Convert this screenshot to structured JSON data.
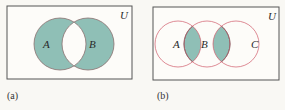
{
  "figure": {
    "colors": {
      "background": "#f9f8f4",
      "box_stroke": "#555555",
      "shade_fill": "#8fbfb6",
      "circle_stroke_a": "#8a7070",
      "circle_stroke_b": "#d05a6a"
    },
    "panels": [
      {
        "caption": "(a)",
        "universe_label": "U",
        "sets": [
          {
            "label": "A"
          },
          {
            "label": "B"
          }
        ],
        "shaded_region": "symmetric difference of A and B (A ∪ B minus A ∩ B)"
      },
      {
        "caption": "(b)",
        "universe_label": "U",
        "sets": [
          {
            "label": "A"
          },
          {
            "label": "B"
          },
          {
            "label": "C"
          }
        ],
        "shaded_region": "A ∩ B and B ∩ C"
      }
    ]
  }
}
